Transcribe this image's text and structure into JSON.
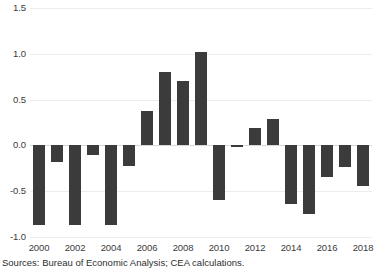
{
  "chart_data": {
    "type": "bar",
    "title": "",
    "subtitle": "",
    "xlabel": "",
    "ylabel": "",
    "ylim": [
      -1.0,
      1.5
    ],
    "ytick_labels": [
      "1.5",
      "1.0",
      "0.5",
      "0.0",
      "-0.5",
      "-1.0"
    ],
    "ytick_values": [
      1.5,
      1.0,
      0.5,
      0.0,
      -0.5,
      -1.0
    ],
    "grid": true,
    "legend": "none",
    "bar_color": "#3b3b3b",
    "gridline_color": "#ececec",
    "zeroline_color": "#d8d8d8",
    "categories": [
      "2000",
      "2001",
      "2002",
      "2003",
      "2004",
      "2005",
      "2006",
      "2007",
      "2008",
      "2009",
      "2010",
      "2011",
      "2012",
      "2013",
      "2014",
      "2015",
      "2016",
      "2017",
      "2018"
    ],
    "values": [
      -0.87,
      -0.18,
      -0.87,
      -0.1,
      -0.87,
      -0.22,
      0.38,
      0.8,
      0.7,
      1.02,
      -0.6,
      -0.02,
      0.19,
      0.29,
      -0.64,
      -0.75,
      -0.35,
      -0.24,
      -0.44
    ],
    "xtick_labels": [
      "2000",
      "2002",
      "2004",
      "2006",
      "2008",
      "2010",
      "2012",
      "2014",
      "2016",
      "2018"
    ]
  },
  "footer": {
    "sources": "Sources: Bureau of Economic Analysis; CEA calculations."
  },
  "cropped_top_text": ""
}
